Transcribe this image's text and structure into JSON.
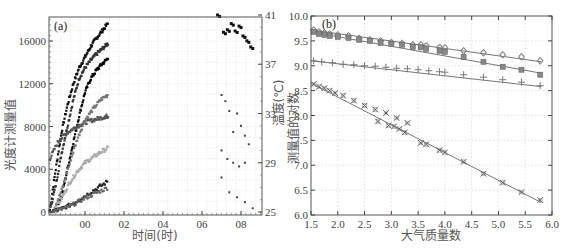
{
  "chart_data": [
    {
      "panel": "(a)",
      "type": "scatter",
      "title": "",
      "xlabel": "时间(时)",
      "ylabel": "光度计测量值",
      "ylabel_right": "温度(℃)",
      "x_ticks": [
        "00",
        "02",
        "04",
        "06",
        "08"
      ],
      "y_ticks": [
        0,
        4000,
        8000,
        12000,
        16000
      ],
      "y_ticks_right": [
        25,
        29,
        33,
        37,
        41
      ],
      "ylim": [
        0,
        18000
      ],
      "ylim_right": [
        25,
        41
      ],
      "grid": true,
      "series": [
        {
          "name": "channel-1",
          "axis": "left",
          "color": "#111111",
          "points": [
            [
              -1.8,
              200
            ],
            [
              -1.5,
              4000
            ],
            [
              -1.2,
              7500
            ],
            [
              -0.9,
              10000
            ],
            [
              -0.6,
              12000
            ],
            [
              -0.3,
              13500
            ],
            [
              0.0,
              14500
            ],
            [
              0.3,
              15500
            ],
            [
              0.6,
              16300
            ],
            [
              0.9,
              17000
            ],
            [
              1.2,
              17700
            ]
          ]
        },
        {
          "name": "channel-2",
          "axis": "left",
          "color": "#333333",
          "points": [
            [
              -1.8,
              150
            ],
            [
              -1.5,
              2500
            ],
            [
              -1.2,
              5500
            ],
            [
              -0.9,
              8000
            ],
            [
              -0.6,
              10500
            ],
            [
              -0.3,
              12500
            ],
            [
              0.0,
              13500
            ],
            [
              0.3,
              14200
            ],
            [
              0.6,
              14800
            ],
            [
              0.9,
              15300
            ],
            [
              1.2,
              15800
            ]
          ]
        },
        {
          "name": "channel-3",
          "axis": "left",
          "color": "#000000",
          "points": [
            [
              -1.6,
              0
            ],
            [
              -1.2,
              1500
            ],
            [
              -0.9,
              4000
            ],
            [
              -0.6,
              6500
            ],
            [
              -0.3,
              9000
            ],
            [
              0.0,
              11200
            ],
            [
              0.3,
              12500
            ],
            [
              0.6,
              13300
            ],
            [
              0.9,
              13900
            ],
            [
              1.2,
              14400
            ]
          ]
        },
        {
          "name": "channel-4",
          "axis": "left",
          "color": "#555555",
          "points": [
            [
              -1.8,
              5000
            ],
            [
              -1.4,
              6500
            ],
            [
              -1.0,
              7300
            ],
            [
              -0.6,
              7800
            ],
            [
              -0.2,
              8200
            ],
            [
              0.2,
              8500
            ],
            [
              0.6,
              8700
            ],
            [
              1.0,
              8900
            ],
            [
              1.2,
              9000
            ]
          ]
        },
        {
          "name": "channel-5",
          "axis": "left",
          "color": "#777777",
          "points": [
            [
              -1.6,
              200
            ],
            [
              -1.2,
              2000
            ],
            [
              -0.8,
              4500
            ],
            [
              -0.4,
              6800
            ],
            [
              0.0,
              8600
            ],
            [
              0.4,
              9600
            ],
            [
              0.8,
              10500
            ],
            [
              1.2,
              11000
            ]
          ]
        },
        {
          "name": "channel-6",
          "axis": "left",
          "color": "#aaaaaa",
          "points": [
            [
              -1.6,
              100
            ],
            [
              -1.2,
              1300
            ],
            [
              -0.8,
              2700
            ],
            [
              -0.4,
              3800
            ],
            [
              0.0,
              4600
            ],
            [
              0.4,
              5100
            ],
            [
              0.8,
              5600
            ],
            [
              1.2,
              6000
            ]
          ]
        },
        {
          "name": "channel-7",
          "axis": "left",
          "color": "#222222",
          "points": [
            [
              -1.8,
              0
            ],
            [
              -1.2,
              300
            ],
            [
              -0.6,
              800
            ],
            [
              0.0,
              1500
            ],
            [
              0.6,
              2200
            ],
            [
              1.2,
              2900
            ]
          ]
        },
        {
          "name": "channel-8",
          "axis": "left",
          "color": "#666666",
          "points": [
            [
              -1.8,
              0
            ],
            [
              -1.2,
              250
            ],
            [
              -0.6,
              700
            ],
            [
              0.0,
              1300
            ],
            [
              0.6,
              1800
            ],
            [
              1.2,
              2300
            ]
          ]
        },
        {
          "name": "temperature-late",
          "axis": "right",
          "color": "#111111",
          "points": [
            [
              6.8,
              41
            ],
            [
              7.1,
              39.6
            ],
            [
              7.3,
              39.8
            ],
            [
              7.5,
              40.3
            ],
            [
              7.7,
              39.7
            ],
            [
              7.9,
              40.1
            ],
            [
              8.1,
              39.3
            ],
            [
              8.3,
              38.9
            ],
            [
              8.5,
              38.4
            ]
          ]
        },
        {
          "name": "late-scatter",
          "axis": "right",
          "color": "#444444",
          "points": [
            [
              7.0,
              34.5
            ],
            [
              7.2,
              34.0
            ],
            [
              7.4,
              33.2
            ],
            [
              7.6,
              31.5
            ],
            [
              7.8,
              33.0
            ],
            [
              8.0,
              32.0
            ],
            [
              8.2,
              31.2
            ],
            [
              8.4,
              30.5
            ],
            [
              7.0,
              30.0
            ],
            [
              7.3,
              29.3
            ],
            [
              7.6,
              29.0
            ],
            [
              7.9,
              28.7
            ],
            [
              8.2,
              29.0
            ],
            [
              7.0,
              27.8
            ],
            [
              7.4,
              26.6
            ],
            [
              7.8,
              26.2
            ],
            [
              8.2,
              25.8
            ],
            [
              8.6,
              25.3
            ]
          ]
        }
      ]
    },
    {
      "panel": "(b)",
      "type": "scatter",
      "title": "",
      "xlabel": "大气质量数",
      "ylabel": "测量值的对数",
      "x_ticks": [
        1.5,
        2.0,
        2.5,
        3.0,
        3.5,
        4.0,
        4.5,
        5.0,
        5.5,
        6.0
      ],
      "y_ticks": [
        6.0,
        6.5,
        7.0,
        7.5,
        8.0,
        8.5,
        9.0,
        9.5,
        10.0
      ],
      "xlim": [
        1.5,
        6.0
      ],
      "ylim": [
        6.0,
        10.0
      ],
      "grid": true,
      "series": [
        {
          "name": "diamond",
          "marker": "diamond",
          "fit": [
            [
              1.5,
              9.72
            ],
            [
              5.8,
              9.08
            ]
          ],
          "points": [
            [
              1.55,
              9.72
            ],
            [
              1.65,
              9.68
            ],
            [
              1.75,
              9.66
            ],
            [
              1.85,
              9.64
            ],
            [
              2.0,
              9.62
            ],
            [
              2.2,
              9.6
            ],
            [
              2.4,
              9.55
            ],
            [
              2.6,
              9.52
            ],
            [
              2.8,
              9.5
            ],
            [
              3.0,
              9.47
            ],
            [
              3.2,
              9.45
            ],
            [
              3.4,
              9.42
            ],
            [
              3.55,
              9.42
            ],
            [
              3.65,
              9.4
            ],
            [
              3.9,
              9.37
            ],
            [
              4.0,
              9.36
            ],
            [
              4.35,
              9.3
            ],
            [
              4.72,
              9.26
            ],
            [
              5.08,
              9.22
            ],
            [
              5.43,
              9.18
            ],
            [
              5.78,
              9.1
            ]
          ]
        },
        {
          "name": "square",
          "marker": "square",
          "fit": [
            [
              1.5,
              9.68
            ],
            [
              5.8,
              8.85
            ]
          ],
          "points": [
            [
              1.55,
              9.68
            ],
            [
              1.65,
              9.64
            ],
            [
              1.75,
              9.62
            ],
            [
              1.85,
              9.6
            ],
            [
              2.0,
              9.58
            ],
            [
              2.2,
              9.56
            ],
            [
              2.4,
              9.52
            ],
            [
              2.6,
              9.5
            ],
            [
              2.8,
              9.46
            ],
            [
              3.0,
              9.44
            ],
            [
              3.2,
              9.42
            ],
            [
              3.4,
              9.38
            ],
            [
              3.55,
              9.37
            ],
            [
              3.65,
              9.34
            ],
            [
              3.9,
              9.3
            ],
            [
              4.0,
              9.28
            ],
            [
              4.35,
              9.18
            ],
            [
              4.72,
              9.08
            ],
            [
              5.08,
              8.98
            ],
            [
              5.43,
              8.92
            ],
            [
              5.78,
              8.82
            ]
          ]
        },
        {
          "name": "plus",
          "marker": "plus",
          "fit": [
            [
              1.5,
              9.1
            ],
            [
              5.8,
              8.58
            ]
          ],
          "points": [
            [
              1.55,
              9.1
            ],
            [
              1.7,
              9.08
            ],
            [
              1.9,
              9.06
            ],
            [
              2.1,
              9.03
            ],
            [
              2.3,
              9.02
            ],
            [
              2.5,
              9.0
            ],
            [
              2.7,
              8.99
            ],
            [
              2.9,
              8.97
            ],
            [
              3.1,
              8.95
            ],
            [
              3.3,
              8.94
            ],
            [
              3.5,
              8.92
            ],
            [
              3.7,
              8.9
            ],
            [
              3.9,
              8.88
            ],
            [
              4.0,
              8.87
            ],
            [
              4.35,
              8.82
            ],
            [
              4.72,
              8.77
            ],
            [
              5.08,
              8.72
            ],
            [
              5.43,
              8.67
            ],
            [
              5.78,
              8.6
            ]
          ]
        },
        {
          "name": "x-cross",
          "marker": "x",
          "fit": [
            [
              1.5,
              8.65
            ],
            [
              5.8,
              6.25
            ]
          ],
          "points": [
            [
              1.55,
              8.63
            ],
            [
              1.65,
              8.58
            ],
            [
              1.75,
              8.55
            ],
            [
              1.85,
              8.5
            ],
            [
              1.95,
              8.45
            ],
            [
              2.1,
              8.4
            ],
            [
              2.3,
              8.3
            ],
            [
              2.5,
              8.2
            ],
            [
              2.7,
              8.12
            ],
            [
              2.9,
              8.05
            ],
            [
              3.1,
              7.95
            ],
            [
              3.3,
              7.85
            ],
            [
              2.75,
              7.88
            ],
            [
              2.95,
              7.8
            ],
            [
              3.05,
              7.78
            ],
            [
              3.15,
              7.73
            ],
            [
              3.25,
              7.66
            ],
            [
              3.55,
              7.45
            ],
            [
              3.65,
              7.42
            ],
            [
              3.9,
              7.3
            ],
            [
              4.0,
              7.26
            ],
            [
              4.35,
              7.07
            ],
            [
              4.72,
              6.83
            ],
            [
              5.08,
              6.65
            ],
            [
              5.43,
              6.46
            ],
            [
              5.78,
              6.3
            ]
          ]
        }
      ]
    }
  ],
  "panel_a": {
    "label": "(a)",
    "xlabel": "时间(时)",
    "ylabel": "光度计测量值",
    "ylabel_right": "温度(℃)",
    "x_ticks": [
      "00",
      "02",
      "04",
      "06",
      "08"
    ],
    "y_ticks": [
      "16000",
      "12000",
      "8000",
      "4000",
      "0"
    ],
    "y_ticks_right": [
      "41",
      "37",
      "33",
      "29",
      "25"
    ]
  },
  "panel_b": {
    "label": "(b)",
    "xlabel": "大气质量数",
    "ylabel": "测量值的对数",
    "x_ticks": [
      "1.5",
      "2.0",
      "2.5",
      "3.0",
      "3.5",
      "4.0",
      "4.5",
      "5.0",
      "5.5",
      "6.0"
    ],
    "y_ticks": [
      "10.0",
      "9.5",
      "9.0",
      "8.5",
      "8.0",
      "7.5",
      "7.0",
      "6.5",
      "6.0"
    ]
  }
}
